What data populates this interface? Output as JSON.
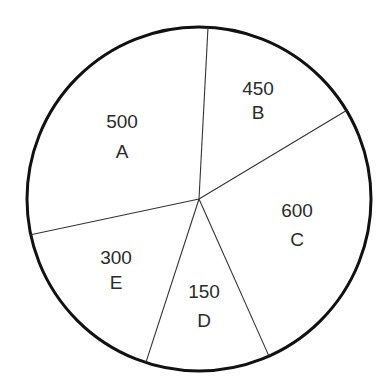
{
  "chart_data": {
    "type": "pie",
    "title": "",
    "categories": [
      "A",
      "B",
      "C",
      "D",
      "E"
    ],
    "values": [
      500,
      450,
      600,
      150,
      300
    ],
    "slices": [
      {
        "label": "A",
        "value": 500
      },
      {
        "label": "B",
        "value": 450
      },
      {
        "label": "C",
        "value": 600
      },
      {
        "label": "D",
        "value": 150
      },
      {
        "label": "E",
        "value": 300
      }
    ],
    "legend": "none",
    "colors": {
      "fill": "#ffffff",
      "outline": "#111111",
      "divider": "#333333",
      "text": "#2b2b2b"
    }
  }
}
